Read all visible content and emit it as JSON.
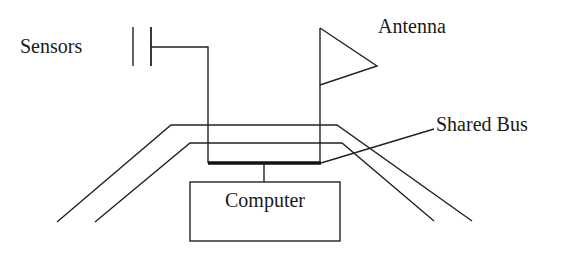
{
  "diagram": {
    "labels": {
      "sensors": "Sensors",
      "antenna": "Antenna",
      "shared_bus": "Shared Bus",
      "computer": "Computer"
    },
    "components": [
      {
        "id": "sensors",
        "shape": "parallel-plate symbol",
        "connected_to": "shared_bus"
      },
      {
        "id": "antenna",
        "shape": "triangular flag",
        "connected_to": "shared_bus"
      },
      {
        "id": "shared_bus",
        "shape": "thick horizontal line"
      },
      {
        "id": "computer",
        "shape": "rectangle",
        "connected_to": "shared_bus"
      },
      {
        "id": "vehicle_outline",
        "shape": "two parallel trapezoidal lines (road/vehicle body)"
      }
    ],
    "colors": {
      "stroke": "#222222",
      "background": "#ffffff",
      "text": "#1a1a1a"
    }
  }
}
